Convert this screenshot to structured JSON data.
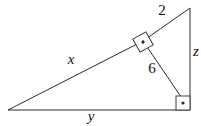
{
  "figure": {
    "kind": "right-triangle-with-altitude",
    "background_color": "#ffffff",
    "line_color": "#2b2b2b",
    "label_color": "#111111",
    "canvas": {
      "width": 201,
      "height": 126
    },
    "vertices": {
      "left": {
        "name": "left-vertex",
        "x": 8,
        "y": 110
      },
      "top_right": {
        "name": "apex-vertex",
        "x": 190,
        "y": 8
      },
      "bottom_right": {
        "name": "right-angle-vertex",
        "x": 190,
        "y": 110
      },
      "altitude_foot": {
        "name": "altitude-foot",
        "x": 143,
        "y": 41
      }
    },
    "segments": [
      {
        "name": "hypotenuse-long-segment",
        "label": "x",
        "from": "left",
        "to": "altitude_foot"
      },
      {
        "name": "hypotenuse-short-segment",
        "label": "2",
        "from": "altitude_foot",
        "to": "top_right"
      },
      {
        "name": "base-segment",
        "label": "y",
        "from": "left",
        "to": "bottom_right"
      },
      {
        "name": "vertical-segment",
        "label": "z",
        "from": "top_right",
        "to": "bottom_right"
      },
      {
        "name": "altitude-segment",
        "label": "6",
        "from": "altitude_foot",
        "to": "bottom_right"
      }
    ],
    "labels": [
      {
        "name": "label-x",
        "text": "x",
        "x": 71,
        "y": 61,
        "style": "italic"
      },
      {
        "name": "label-2",
        "text": "2",
        "x": 162,
        "y": 12,
        "style": "numeral"
      },
      {
        "name": "label-z",
        "text": "z",
        "x": 196,
        "y": 53,
        "style": "italic"
      },
      {
        "name": "label-6",
        "text": "6",
        "x": 152,
        "y": 70,
        "style": "numeral"
      },
      {
        "name": "label-y",
        "text": "y",
        "x": 91,
        "y": 118,
        "style": "italic"
      }
    ],
    "right_angle_markers": [
      {
        "name": "right-angle-marker-altitude-foot",
        "center_x": 143,
        "center_y": 42,
        "size": 15,
        "rotation_deg": -29,
        "has_dot": true
      },
      {
        "name": "right-angle-marker-corner",
        "center_x": 183,
        "center_y": 103,
        "size": 14,
        "rotation_deg": 0,
        "has_dot": true
      }
    ]
  }
}
